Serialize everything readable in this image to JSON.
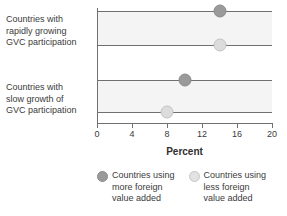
{
  "chart_data": {
    "type": "scatter",
    "title": "",
    "xlabel": "Percent",
    "ylabel": "",
    "xlim": [
      0,
      20
    ],
    "grid": false,
    "legend_position": "bottom",
    "xticks": [
      "0",
      "4",
      "8",
      "12",
      "16",
      "20"
    ],
    "xtick_values": [
      0,
      4,
      8,
      12,
      16,
      20
    ],
    "categories": [
      "Countries with rapidly growing GVC participation",
      "Countries with slow growth of GVC participation"
    ],
    "series": [
      {
        "name": "Countries using more foreign value added",
        "color": "#9a9a9a",
        "values": [
          14,
          10
        ]
      },
      {
        "name": "Countries using less foreign value added",
        "color": "#dcdcdc",
        "values": [
          14,
          8
        ]
      }
    ],
    "rows": [
      {
        "category_index": 0,
        "series": "more",
        "value": 14
      },
      {
        "category_index": 0,
        "series": "less",
        "value": 14
      },
      {
        "category_index": 1,
        "series": "more",
        "value": 10
      },
      {
        "category_index": 1,
        "series": "less",
        "value": 8
      }
    ]
  },
  "categories": {
    "group_1": "Countries with\nrapidly growing\nGVC participation",
    "group_1_line_1": "Countries with",
    "group_1_line_2": "rapidly growing",
    "group_1_line_3": "GVC participation",
    "group_2": "Countries with\nslow growth of\nGVC participation",
    "group_2_line_1": "Countries with",
    "group_2_line_2": "slow growth of",
    "group_2_line_3": "GVC participation"
  },
  "axis": {
    "title": "Percent",
    "ticks": [
      "0",
      "4",
      "8",
      "12",
      "16",
      "20"
    ]
  },
  "legend": {
    "item_1_label": "Countries using\nmore foreign\nvalue added",
    "item_2_label": "Countries using\nless foreign\nvalue added"
  },
  "colors": {
    "marker_more": "#9a9a9a",
    "marker_less": "#dcdcdc",
    "band": "#f4f4f4",
    "rule": "#707070",
    "text": "#3b3b3b"
  }
}
